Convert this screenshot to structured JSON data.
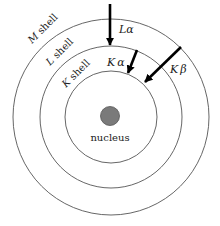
{
  "diagram": {
    "nucleus": {
      "label": "nucleus",
      "fill": "#7a7a7a"
    },
    "shells": [
      {
        "id": "K",
        "letter": "K",
        "suffix": " shell"
      },
      {
        "id": "L",
        "letter": "L",
        "suffix": " shell"
      },
      {
        "id": "M",
        "letter": "M",
        "suffix": " shell"
      }
    ],
    "transitions": [
      {
        "id": "L-alpha",
        "letter": "L",
        "greek": "α"
      },
      {
        "id": "K-alpha",
        "letter": "K",
        "greek": "α"
      },
      {
        "id": "K-beta",
        "letter": "K",
        "greek": "β"
      }
    ],
    "colors": {
      "line": "#555555",
      "arrow": "#000000",
      "text": "#222222"
    }
  }
}
